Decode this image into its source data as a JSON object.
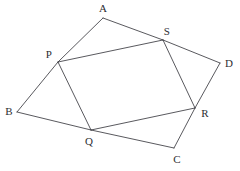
{
  "figure": {
    "kind": "geometry-diagram",
    "canvas": {
      "width": 240,
      "height": 171,
      "background": "#ffffff"
    },
    "stroke_color": "#3b3b41",
    "stroke_width": 0.85,
    "label_color": "#2e2e33",
    "label_font_size": 11,
    "points": {
      "A": {
        "label": "A",
        "x": 103,
        "y": 18,
        "label_x": 103,
        "label_y": 8
      },
      "B": {
        "label": "B",
        "x": 17,
        "y": 112,
        "label_x": 9,
        "label_y": 111
      },
      "C": {
        "label": "C",
        "x": 174,
        "y": 148,
        "label_x": 177,
        "label_y": 159
      },
      "D": {
        "label": "D",
        "x": 220,
        "y": 63,
        "label_x": 229,
        "label_y": 63
      },
      "P": {
        "label": "P",
        "x": 58,
        "y": 62,
        "label_x": 49,
        "label_y": 54
      },
      "Q": {
        "label": "Q",
        "x": 91,
        "y": 130,
        "label_x": 89,
        "label_y": 141
      },
      "R": {
        "label": "R",
        "x": 195,
        "y": 108,
        "label_x": 205,
        "label_y": 113
      },
      "S": {
        "label": "S",
        "x": 163,
        "y": 40,
        "label_x": 167,
        "label_y": 31
      }
    },
    "edges": [
      {
        "name": "edge-A-S",
        "from": "A",
        "to": "S",
        "d": "M 103 18 L 163 40"
      },
      {
        "name": "edge-S-D",
        "from": "S",
        "to": "D",
        "d": "M 163 40 L 220 63"
      },
      {
        "name": "edge-D-R",
        "from": "D",
        "to": "R",
        "d": "M 220 63 L 195 108"
      },
      {
        "name": "edge-R-C",
        "from": "R",
        "to": "C",
        "d": "M 195 108 L 174 148"
      },
      {
        "name": "edge-C-Q",
        "from": "C",
        "to": "Q",
        "d": "M 174 148 L 91 130"
      },
      {
        "name": "edge-Q-B",
        "from": "Q",
        "to": "B",
        "d": "M 91 130 L 17 112"
      },
      {
        "name": "edge-B-P",
        "from": "B",
        "to": "P",
        "d": "M 17 112 L 58 62"
      },
      {
        "name": "edge-P-A",
        "from": "P",
        "to": "A",
        "d": "M 58 62 L 103 18"
      },
      {
        "name": "edge-P-S",
        "from": "P",
        "to": "S",
        "d": "M 58 62 L 163 40"
      },
      {
        "name": "edge-S-R",
        "from": "S",
        "to": "R",
        "d": "M 163 40 L 195 108"
      },
      {
        "name": "edge-R-Q",
        "from": "R",
        "to": "Q",
        "d": "M 195 108 L 91 130"
      },
      {
        "name": "edge-Q-P",
        "from": "Q",
        "to": "P",
        "d": "M 91 130 L 58 62"
      }
    ]
  }
}
